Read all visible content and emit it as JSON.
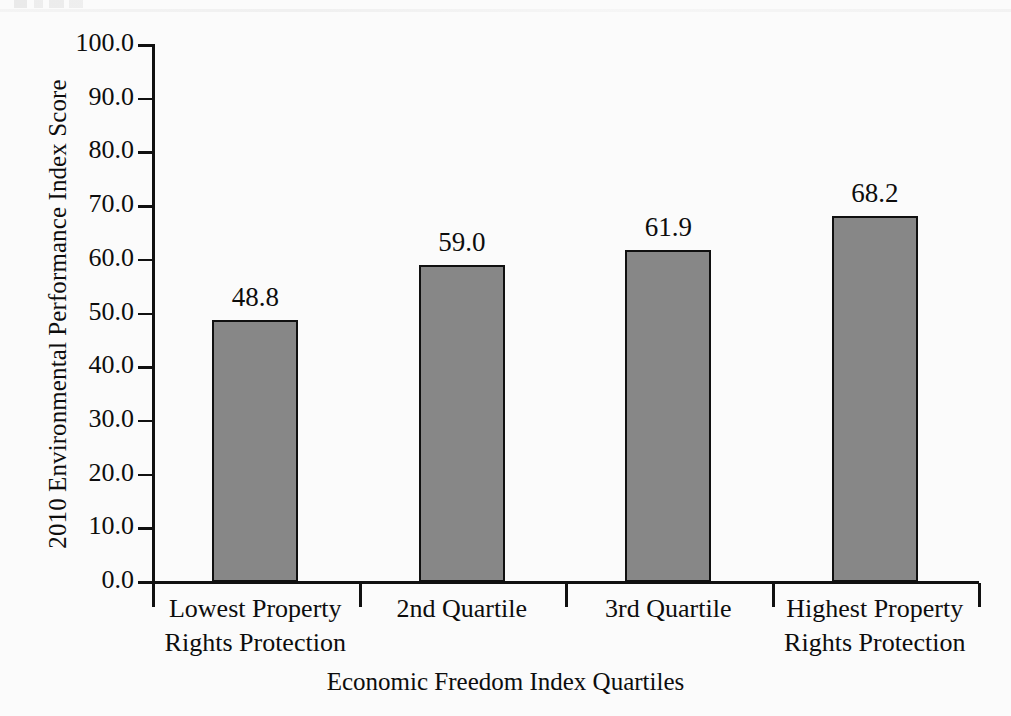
{
  "chart_data": {
    "type": "bar",
    "title": "",
    "xlabel": "Economic Freedom Index Quartiles",
    "ylabel": "2010 Environmental Performance Index Score",
    "categories": [
      "Lowest Property Rights Protection",
      "2nd Quartile",
      "3rd Quartile",
      "Highest Property Rights Protection"
    ],
    "category_lines": [
      [
        "Lowest Property",
        "Rights Protection"
      ],
      [
        "2nd Quartile",
        ""
      ],
      [
        "3rd Quartile",
        ""
      ],
      [
        "Highest Property",
        "Rights Protection"
      ]
    ],
    "values": [
      48.8,
      59.0,
      61.9,
      68.2
    ],
    "value_labels": [
      "48.8",
      "59.0",
      "61.9",
      "68.2"
    ],
    "ylim": [
      0,
      100
    ],
    "ytick_values": [
      100.0,
      90.0,
      80.0,
      70.0,
      60.0,
      50.0,
      40.0,
      30.0,
      20.0,
      10.0,
      0.0
    ],
    "ytick_labels": [
      "100.0",
      "90.0",
      "80.0",
      "70.0",
      "60.0",
      "50.0",
      "40.0",
      "30.0",
      "20.0",
      "10.0",
      "0.0"
    ],
    "grid": false,
    "legend": null,
    "legend_position": "none",
    "bar_fill_color": "#878787",
    "bar_border_color": "#101010",
    "background_color": "#fbfbfb",
    "text_color": "#0d0d0d"
  },
  "figure": {
    "top_bleed_text": ""
  }
}
